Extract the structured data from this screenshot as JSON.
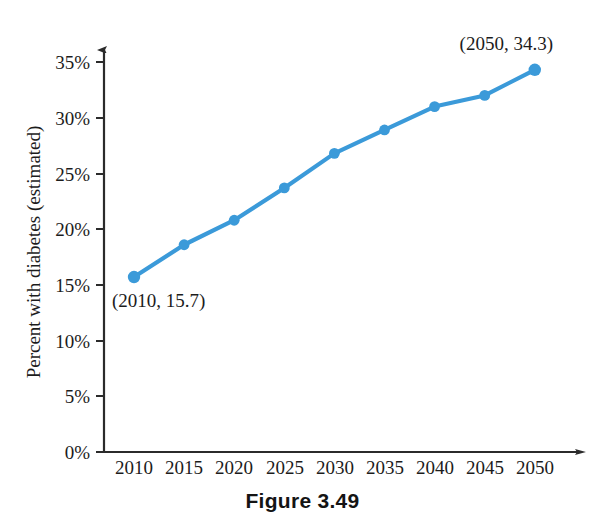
{
  "figure": {
    "caption": "Figure 3.49"
  },
  "chart_data": {
    "type": "line",
    "title": "",
    "xlabel": "",
    "ylabel": "Percent with diabetes (estimated)",
    "categories": [
      "2010",
      "2015",
      "2020",
      "2025",
      "2030",
      "2035",
      "2040",
      "2045",
      "2050"
    ],
    "x": [
      2010,
      2015,
      2020,
      2025,
      2030,
      2035,
      2040,
      2045,
      2050
    ],
    "values": [
      15.7,
      18.6,
      20.8,
      23.7,
      26.8,
      28.9,
      31.0,
      32.0,
      34.3
    ],
    "series": [
      {
        "name": "Percent with diabetes (estimated)",
        "values": [
          15.7,
          18.6,
          20.8,
          23.7,
          26.8,
          28.9,
          31.0,
          32.0,
          34.3
        ],
        "color": "#3b9ad9",
        "marker": "circle"
      }
    ],
    "ylim": [
      0,
      36
    ],
    "xlim": [
      2007.5,
      2052.5
    ],
    "ytick_labels": [
      "0%",
      "5%",
      "10%",
      "15%",
      "20%",
      "25%",
      "30%",
      "35%"
    ],
    "ytick_values": [
      0,
      5,
      10,
      15,
      20,
      25,
      30,
      35
    ],
    "xtick_labels": [
      "2010",
      "2015",
      "2020",
      "2025",
      "2030",
      "2035",
      "2040",
      "2045",
      "2050"
    ],
    "grid": false,
    "legend": "none",
    "annotations": [
      {
        "text": "(2010, 15.7)",
        "x": 2010,
        "y": 15.7,
        "position": "below-right"
      },
      {
        "text": "(2050, 34.3)",
        "x": 2050,
        "y": 34.3,
        "position": "above-left"
      }
    ]
  },
  "axis": {
    "y_ticks": [
      {
        "label": "35%",
        "value": 35
      },
      {
        "label": "30%",
        "value": 30
      },
      {
        "label": "25%",
        "value": 25
      },
      {
        "label": "20%",
        "value": 20
      },
      {
        "label": "15%",
        "value": 15
      },
      {
        "label": "10%",
        "value": 10
      },
      {
        "label": "5%",
        "value": 5
      },
      {
        "label": "0%",
        "value": 0
      }
    ],
    "x_ticks": [
      {
        "label": "2010"
      },
      {
        "label": "2015"
      },
      {
        "label": "2020"
      },
      {
        "label": "2025"
      },
      {
        "label": "2030"
      },
      {
        "label": "2035"
      },
      {
        "label": "2040"
      },
      {
        "label": "2045"
      },
      {
        "label": "2050"
      }
    ],
    "y_axis_title": "Percent with diabetes (estimated)"
  },
  "annotations": {
    "first_point": "(2010, 15.7)",
    "last_point": "(2050, 34.3)"
  },
  "colors": {
    "series": "#3b9ad9",
    "axis": "#2b2b2b",
    "text": "#1c1c1c",
    "background": "#ffffff"
  }
}
